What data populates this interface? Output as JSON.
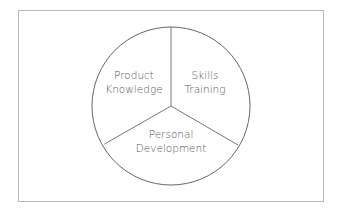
{
  "diagram": {
    "type": "pie-divided-circle",
    "segments": [
      {
        "line1": "Product",
        "line2": "Knowledge"
      },
      {
        "line1": "Skills",
        "line2": "Training"
      },
      {
        "line1": "Personal",
        "line2": "Development"
      }
    ]
  }
}
